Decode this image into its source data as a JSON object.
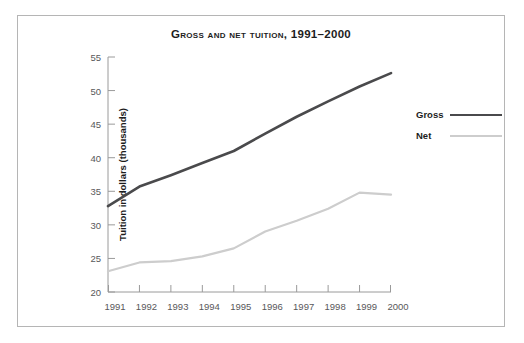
{
  "figure": {
    "title": "Gross and Net Tuition, 1991–2000",
    "border_color": "#b5b5b5",
    "background": "#ffffff"
  },
  "axes": {
    "y_title": "Tuition in dollars (thousands)",
    "y_ticks": [
      "55",
      "50",
      "45",
      "40",
      "35",
      "30",
      "25",
      "20"
    ],
    "x_ticks": [
      "1991",
      "1992",
      "1993",
      "1994",
      "1995",
      "1996",
      "1997",
      "1998",
      "1999",
      "2000"
    ],
    "axis_color": "#9a9a9a",
    "tick_label_color": "#58585a"
  },
  "legend": {
    "position": "right",
    "items": [
      {
        "label": "Gross",
        "color": "#4a4a4c"
      },
      {
        "label": "Net",
        "color": "#cdcdcd"
      }
    ]
  },
  "chart_data": {
    "type": "line",
    "title": "Gross and Net Tuition, 1991–2000",
    "xlabel": "",
    "ylabel": "Tuition in dollars (thousands)",
    "x": [
      1991,
      1992,
      1993,
      1994,
      1995,
      1996,
      1997,
      1998,
      1999,
      2000
    ],
    "categories": [
      "1991",
      "1992",
      "1993",
      "1994",
      "1995",
      "1996",
      "1997",
      "1998",
      "1999",
      "2000"
    ],
    "series": [
      {
        "name": "Gross",
        "color": "#4a4a4c",
        "values": [
          32.8,
          35.7,
          37.4,
          39.2,
          41.0,
          43.6,
          46.1,
          48.4,
          50.6,
          52.6
        ]
      },
      {
        "name": "Net",
        "color": "#cdcdcd",
        "values": [
          23.1,
          24.4,
          24.6,
          25.3,
          26.5,
          29.0,
          30.6,
          32.4,
          34.8,
          34.5
        ]
      }
    ],
    "xlim": [
      1991,
      2000
    ],
    "ylim": [
      20,
      55
    ],
    "ytick_step": 5,
    "grid": false,
    "legend_position": "right"
  }
}
